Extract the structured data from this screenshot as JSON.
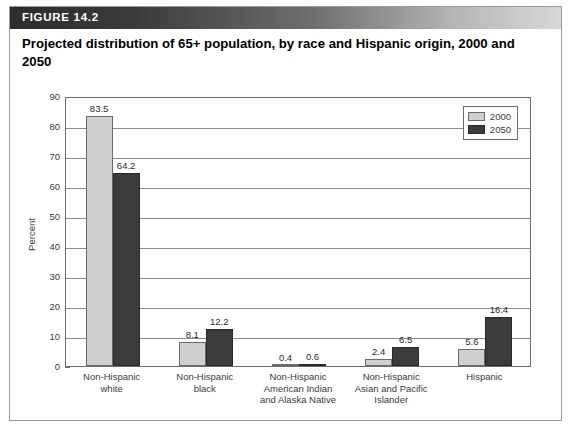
{
  "figure": {
    "label": "FIGURE 14.2",
    "title": "Projected distribution of 65+ population, by race and Hispanic origin, 2000 and 2050"
  },
  "legend": {
    "position": "top-right",
    "entries": [
      {
        "label": "2000",
        "color": "#cfcfcf"
      },
      {
        "label": "2050",
        "color": "#3b3b3b"
      }
    ]
  },
  "chart_data": {
    "type": "bar",
    "title": "Projected distribution of 65+ population, by race and Hispanic origin, 2000 and 2050",
    "xlabel": "",
    "ylabel": "Percent",
    "ylim": [
      0,
      90
    ],
    "ytick_step": 10,
    "yticks": [
      "0",
      "10",
      "20",
      "30",
      "40",
      "50",
      "60",
      "70",
      "80",
      "90"
    ],
    "grid": true,
    "legend_position": "top-right",
    "categories": [
      "Non-Hispanic white",
      "Non-Hispanic black",
      "Non-Hispanic American Indian and Alaska Native",
      "Non-Hispanic Asian and Pacific Islander",
      "Hispanic"
    ],
    "category_lines": [
      [
        "Non-Hispanic",
        "white"
      ],
      [
        "Non-Hispanic",
        "black"
      ],
      [
        "Non-Hispanic",
        "American Indian",
        "and Alaska Native"
      ],
      [
        "Non-Hispanic",
        "Asian and Pacific",
        "Islander"
      ],
      [
        "Hispanic"
      ]
    ],
    "series": [
      {
        "name": "2000",
        "color": "#cfcfcf",
        "values": [
          83.5,
          8.1,
          0.4,
          2.4,
          5.6
        ],
        "labels": [
          "83.5",
          "8.1",
          "0.4",
          "2.4",
          "5.6"
        ]
      },
      {
        "name": "2050",
        "color": "#3b3b3b",
        "values": [
          64.2,
          12.2,
          0.6,
          6.5,
          16.4
        ],
        "labels": [
          "64.2",
          "12.2",
          "0.6",
          "6.5",
          "16.4"
        ]
      }
    ]
  }
}
